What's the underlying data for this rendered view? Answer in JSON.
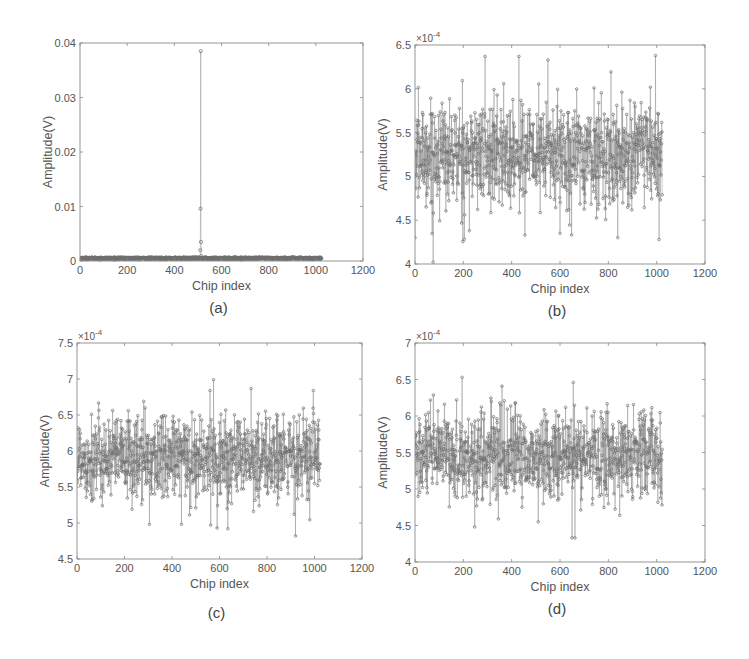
{
  "figure": {
    "panels": [
      "a",
      "b",
      "c",
      "d"
    ]
  },
  "chart_data": [
    {
      "id": "a",
      "caption": "(a)",
      "type": "line",
      "marker": "circle",
      "color": "#7a7a7a",
      "xlabel": "Chip index",
      "ylabel": "Amplitude(V)",
      "xlim": [
        0,
        1200
      ],
      "ylim": [
        0,
        0.04
      ],
      "xticks": [
        0,
        200,
        400,
        600,
        800,
        1000,
        1200
      ],
      "yticks": [
        0,
        0.01,
        0.02,
        0.03,
        0.04
      ],
      "ytick_labels": [
        "0",
        "0.01",
        "0.02",
        "0.03",
        "0.04"
      ],
      "y_exponent_label": "",
      "n_points": 1024,
      "baseline_mean": 0.0005,
      "baseline_jitter": 8e-05,
      "peaks": [
        {
          "x": 512,
          "y": 0.0385
        },
        {
          "x": 511,
          "y": 0.0096
        },
        {
          "x": 513,
          "y": 0.0035
        },
        {
          "x": 510,
          "y": 0.002
        },
        {
          "x": 514,
          "y": 0.0009
        }
      ],
      "box": {
        "left": 80,
        "top": 43,
        "right": 363,
        "bottom": 261
      }
    },
    {
      "id": "b",
      "caption": "(b)",
      "type": "line",
      "marker": "circle",
      "color": "#7a7a7a",
      "xlabel": "Chip index",
      "ylabel": "Amplitude(V)",
      "xlim": [
        0,
        1200
      ],
      "ylim": [
        4,
        6.5
      ],
      "y_scale": "x 10^-4",
      "xticks": [
        0,
        200,
        400,
        600,
        800,
        1000,
        1200
      ],
      "yticks": [
        4,
        4.5,
        5,
        5.5,
        6,
        6.5
      ],
      "ytick_labels": [
        "4",
        "4.5",
        "5",
        "5.5",
        "6",
        "6.5"
      ],
      "y_exponent_label": "×10",
      "y_exponent_power": "-4",
      "n_points": 1024,
      "mean": 5.25,
      "std": 0.3,
      "min": 4.02,
      "max": 6.38,
      "notable_points": [
        {
          "x": 0,
          "y": 4.3
        },
        {
          "x": 75,
          "y": 4.02
        },
        {
          "x": 290,
          "y": 6.37
        },
        {
          "x": 430,
          "y": 6.37
        },
        {
          "x": 550,
          "y": 6.33
        },
        {
          "x": 995,
          "y": 6.38
        },
        {
          "x": 1010,
          "y": 4.28
        },
        {
          "x": 225,
          "y": 4.38
        },
        {
          "x": 600,
          "y": 4.35
        },
        {
          "x": 455,
          "y": 4.33
        }
      ],
      "box": {
        "left": 415,
        "top": 45,
        "right": 705,
        "bottom": 264
      }
    },
    {
      "id": "c",
      "caption": "(c)",
      "type": "line",
      "marker": "circle",
      "color": "#7a7a7a",
      "xlabel": "Chip index",
      "ylabel": "Amplitude(V)",
      "xlim": [
        0,
        1200
      ],
      "ylim": [
        4.5,
        7.5
      ],
      "y_scale": "x 10^-4",
      "xticks": [
        0,
        200,
        400,
        600,
        800,
        1000,
        1200
      ],
      "yticks": [
        4.5,
        5,
        5.5,
        6,
        6.5,
        7,
        7.5
      ],
      "ytick_labels": [
        "4.5",
        "5",
        "5.5",
        "6",
        "6.5",
        "7",
        "7.5"
      ],
      "y_exponent_label": "×10",
      "y_exponent_power": "-4",
      "n_points": 1024,
      "mean": 5.9,
      "std": 0.3,
      "min": 4.82,
      "max": 7.0,
      "notable_points": [
        {
          "x": 575,
          "y": 6.99
        },
        {
          "x": 560,
          "y": 6.84
        },
        {
          "x": 995,
          "y": 6.84
        },
        {
          "x": 920,
          "y": 4.82
        },
        {
          "x": 590,
          "y": 4.93
        },
        {
          "x": 635,
          "y": 4.92
        },
        {
          "x": 305,
          "y": 4.98
        },
        {
          "x": 440,
          "y": 4.98
        }
      ],
      "box": {
        "left": 77,
        "top": 343,
        "right": 362,
        "bottom": 559
      }
    },
    {
      "id": "d",
      "caption": "(d)",
      "type": "line",
      "marker": "circle",
      "color": "#7a7a7a",
      "xlabel": "Chip index",
      "ylabel": "Amplitude(V)",
      "xlim": [
        0,
        1200
      ],
      "ylim": [
        4,
        7
      ],
      "y_scale": "x 10^-4",
      "xticks": [
        0,
        200,
        400,
        600,
        800,
        1000,
        1200
      ],
      "yticks": [
        4,
        4.5,
        5,
        5.5,
        6,
        6.5,
        7
      ],
      "ytick_labels": [
        "4",
        "4.5",
        "5",
        "5.5",
        "6",
        "6.5",
        "7"
      ],
      "y_exponent_label": "×10",
      "y_exponent_power": "-4",
      "n_points": 1024,
      "mean": 5.45,
      "std": 0.3,
      "min": 4.33,
      "max": 6.53,
      "notable_points": [
        {
          "x": 195,
          "y": 6.53
        },
        {
          "x": 655,
          "y": 6.46
        },
        {
          "x": 360,
          "y": 6.41
        },
        {
          "x": 650,
          "y": 4.33
        },
        {
          "x": 662,
          "y": 4.33
        },
        {
          "x": 345,
          "y": 4.59
        },
        {
          "x": 510,
          "y": 4.55
        }
      ],
      "box": {
        "left": 415,
        "top": 343,
        "right": 705,
        "bottom": 562
      }
    }
  ]
}
